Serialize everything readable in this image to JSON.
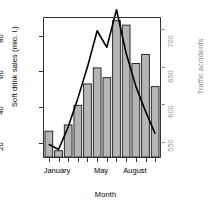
{
  "chart_data": {
    "type": "bar",
    "title": "",
    "xlabel": "Month",
    "ylabel": "Soft drink sales (mio. l.)",
    "y2label": "Traffic accidents",
    "categories": [
      "January",
      "February",
      "March",
      "April",
      "May",
      "June",
      "July",
      "August",
      "September",
      "October",
      "November",
      "December"
    ],
    "xtick_labels": [
      "January",
      "May",
      "August"
    ],
    "xtick_positions": [
      1,
      5,
      8
    ],
    "grid": false,
    "legend": false,
    "ylim": [
      12,
      90
    ],
    "yticks": [
      20,
      40,
      60,
      80
    ],
    "ytick_labels": [
      "20",
      "40",
      "60",
      "80"
    ],
    "y2lim": [
      530,
      715
    ],
    "y2ticks": [
      550,
      600,
      650,
      700
    ],
    "y2tick_labels": [
      "550",
      "600",
      "650",
      "700"
    ],
    "series": [
      {
        "name": "Soft drink sales (mio. l.)",
        "type": "bar",
        "axis": "left",
        "color": "#b5b5b5",
        "edge_color": "#1a1a1a",
        "values": [
          26.5,
          15.5,
          30,
          41,
          53,
          62,
          56.5,
          88.5,
          86,
          64.5,
          69.5,
          51.5
        ]
      },
      {
        "name": "Traffic accidents",
        "type": "line",
        "axis": "right",
        "color": "#000000",
        "values": [
          547,
          540,
          570,
          608,
          650,
          698,
          676,
          726,
          668,
          624,
          591,
          561
        ]
      }
    ]
  },
  "axes": {
    "left_title": "Soft drink sales (mio. l.)",
    "right_title": "Traffic accidents",
    "bottom_title": "Month"
  },
  "colors": {
    "bar_fill": "#b5b5b5",
    "bar_edge": "#1a1a1a",
    "line": "#000000",
    "right_axis_text": "#999999",
    "frame": "#333333",
    "background": "#ffffff"
  }
}
